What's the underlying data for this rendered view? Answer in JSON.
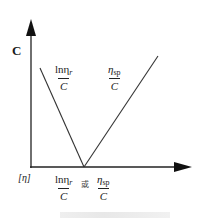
{
  "diagram": {
    "y_axis_label": "C",
    "x_axis_origin_label": "[η]",
    "left_line_label": {
      "numerator": "lnη",
      "numerator_sub": "r",
      "denominator": "C"
    },
    "right_line_label": {
      "numerator": "η",
      "numerator_sub": "sp",
      "denominator": "C"
    },
    "x_axis_label": {
      "left": {
        "numerator": "lnη",
        "numerator_sub": "r",
        "denominator": "C"
      },
      "connector": "或",
      "right": {
        "numerator": "η",
        "numerator_sub": "sp",
        "denominator": "C"
      }
    },
    "colors": {
      "line": "#222222",
      "background": "#ffffff"
    }
  }
}
